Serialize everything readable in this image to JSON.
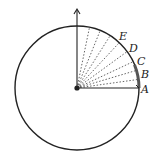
{
  "diagram": {
    "labels": {
      "A": "A",
      "B": "B",
      "C": "C",
      "D": "D",
      "E": "E"
    },
    "colors": {
      "stroke": "#222222",
      "dotted": "#555555",
      "highlight_arc": "#555555"
    }
  }
}
